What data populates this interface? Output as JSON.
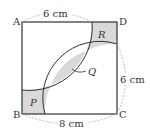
{
  "figure": {
    "vertices": {
      "A": "A",
      "B": "B",
      "C": "C",
      "D": "D"
    },
    "regions": {
      "P": "P",
      "Q": "Q",
      "R": "R"
    },
    "dimensions": {
      "top": "6 cm",
      "right": "6 cm",
      "bottom": "8 cm"
    },
    "colors": {
      "shade": "#d9d9d9",
      "stroke": "#333333",
      "dashed": "#aaaaaa"
    }
  }
}
